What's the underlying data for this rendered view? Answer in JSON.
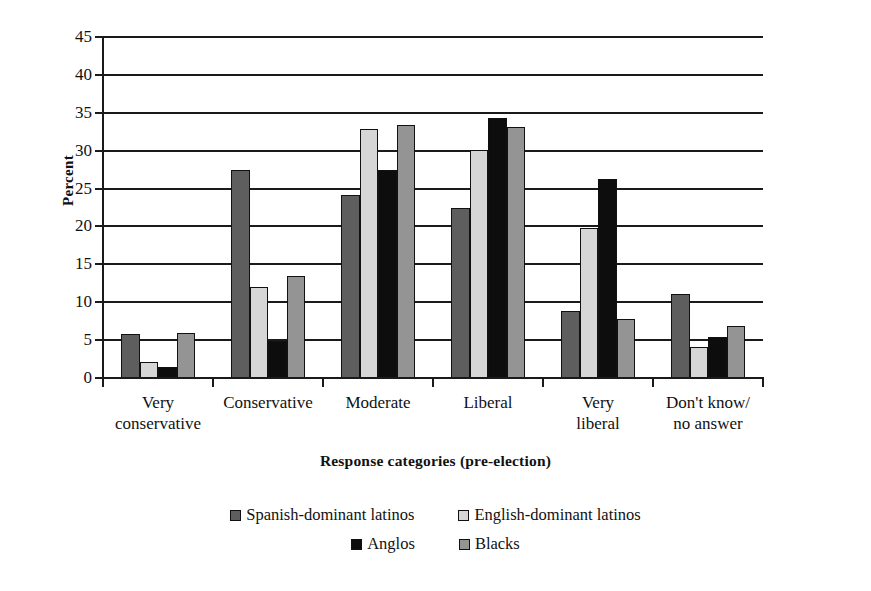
{
  "chart_data": {
    "type": "bar",
    "title": "",
    "xlabel": "Response categories (pre-election)",
    "ylabel": "Percent",
    "ylim": [
      0,
      45
    ],
    "ytick_step": 5,
    "yticks": [
      45,
      40,
      35,
      30,
      25,
      20,
      15,
      10,
      5,
      0
    ],
    "grid": true,
    "legend_position": "bottom",
    "categories": [
      "Very conservative",
      "Conservative",
      "Moderate",
      "Liberal",
      "Very liberal",
      "Don't know/no answer"
    ],
    "category_lines": [
      [
        "Very",
        "conservative"
      ],
      [
        "Conservative",
        ""
      ],
      [
        "Moderate",
        ""
      ],
      [
        "Liberal",
        ""
      ],
      [
        "Very",
        "liberal"
      ],
      [
        "Don't know/",
        "no answer"
      ]
    ],
    "series": [
      {
        "name": "Spanish-dominant latinos",
        "color": "#5e5e5e",
        "values": [
          5.8,
          27.4,
          24.1,
          22.5,
          8.9,
          11.1
        ]
      },
      {
        "name": "English-dominant latinos",
        "color": "#d6d6d6",
        "values": [
          2.1,
          12.0,
          32.8,
          30.1,
          19.8,
          4.1
        ]
      },
      {
        "name": "Anglos",
        "color": "#0d0d0d",
        "values": [
          1.5,
          4.9,
          27.5,
          34.3,
          26.2,
          5.4
        ]
      },
      {
        "name": "Blacks",
        "color": "#949494",
        "values": [
          5.9,
          13.5,
          33.4,
          33.1,
          7.8,
          6.8
        ]
      }
    ]
  },
  "legend": {
    "rows": [
      [
        "Spanish-dominant latinos",
        "English-dominant latinos"
      ],
      [
        "Anglos",
        "Blacks"
      ]
    ]
  }
}
